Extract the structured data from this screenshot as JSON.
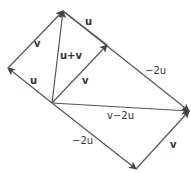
{
  "diagram": {
    "points": {
      "origin": [
        52,
        103
      ],
      "u": [
        8,
        68
      ],
      "v": [
        107,
        45
      ],
      "u_plus_v": [
        63,
        11
      ],
      "neg2u": [
        136,
        169
      ],
      "v_minus_2u": [
        189,
        111
      ]
    },
    "labels": {
      "u_origin": "u",
      "v_left": "v",
      "u_plus_v": "u+v",
      "v_origin": "v",
      "u_top": "u",
      "neg2u_top": "−2u",
      "v_minus_2u": "v−2u",
      "neg2u_bottom": "−2u",
      "v_bottom": "v"
    },
    "colors": {
      "line": "#555555",
      "text": "#333333"
    }
  }
}
